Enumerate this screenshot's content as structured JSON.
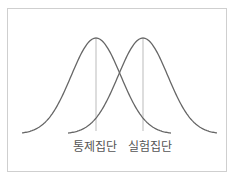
{
  "diagram": {
    "title": "",
    "type": "overlapping normal distributions",
    "curves": [
      {
        "name": "control",
        "label": "통제집단",
        "mean_x": 96,
        "x_start": 22,
        "x_end": 171,
        "peak_y": 37,
        "base_y": 133
      },
      {
        "name": "experimental",
        "label": "실험집단",
        "mean_x": 143,
        "x_start": 68,
        "x_end": 217,
        "peak_y": 37,
        "base_y": 133
      }
    ],
    "colors": {
      "curve": "#666666",
      "mean_line": "#bbbbbb",
      "frame": "#cfcfcf",
      "text": "#555555"
    }
  },
  "labels": {
    "control": "통제집단",
    "experimental": "실험집단"
  }
}
